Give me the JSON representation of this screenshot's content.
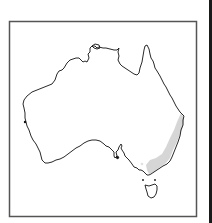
{
  "map": {
    "title": "Distribution map of Australia",
    "region": "Australia",
    "highlighted_region": "South-eastern coastal Australia (eastern NSW and Victoria)",
    "colors": {
      "frame": "#555555",
      "outline": "#111111",
      "land": "#ffffff",
      "highlight": "#d6d6d6",
      "right_edge": "#1a1a1a"
    }
  }
}
